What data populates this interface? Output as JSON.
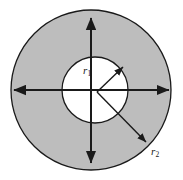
{
  "figure": {
    "type": "annulus-diagram",
    "background_color": "#ffffff",
    "fill_color": "#bdbdbd",
    "stroke_color": "#1a1a1a",
    "labels": {
      "inner_radius": "r",
      "inner_radius_subscript": "1",
      "outer_radius": "r",
      "outer_radius_subscript": "2"
    },
    "geometry": {
      "outer_circle": {
        "cx": 91,
        "cy": 90,
        "r": 80
      },
      "inner_circle": {
        "cx": 95,
        "cy": 90,
        "r": 33
      },
      "arrows": [
        {
          "name": "horizontal-diameter-arrow",
          "x1": 13,
          "y1": 90,
          "x2": 170,
          "y2": 90
        },
        {
          "name": "vertical-diameter-arrow",
          "x1": 91,
          "y1": 17,
          "x2": 91,
          "y2": 164
        }
      ],
      "vertex": {
        "x": 97,
        "y": 92
      },
      "inner_radius_arrow_tip": {
        "x": 124,
        "y": 66
      },
      "outer_radius_arrow_tip": {
        "x": 147,
        "y": 143
      }
    }
  }
}
